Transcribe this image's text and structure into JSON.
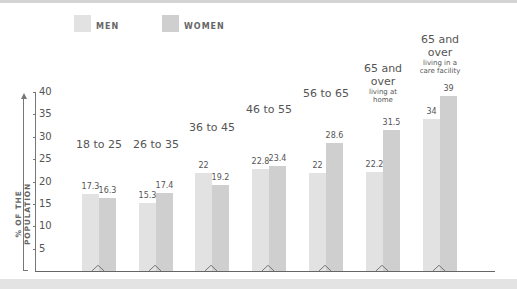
{
  "legend": {
    "men": {
      "label": "MEN",
      "color": "#e2e2e2"
    },
    "women": {
      "label": "WOMEN",
      "color": "#cfcfcf"
    }
  },
  "y_axis": {
    "title": "% OF THE POPULATION",
    "ticks": [
      "40",
      "35",
      "30",
      "25",
      "20",
      "15",
      "10",
      "5"
    ]
  },
  "groups": [
    {
      "title": "18 to 25",
      "subtitle": "",
      "men": "17.3",
      "women": "16.3"
    },
    {
      "title": "26 to 35",
      "subtitle": "",
      "men": "15.3",
      "women": "17.4"
    },
    {
      "title": "36 to 45",
      "subtitle": "",
      "men": "22",
      "women": "19.2"
    },
    {
      "title": "46 to 55",
      "subtitle": "",
      "men": "22.8",
      "women": "23.4"
    },
    {
      "title": "56 to 65",
      "subtitle": "",
      "men": "22",
      "women": "28.6"
    },
    {
      "title": "65 and over",
      "subtitle": "living at home",
      "men": "22.2",
      "women": "31.5"
    },
    {
      "title": "65 and over",
      "subtitle": "living in a care facility",
      "men": "34",
      "women": "39"
    }
  ],
  "chart_data": {
    "type": "bar",
    "title": "",
    "xlabel": "",
    "ylabel": "% OF THE POPULATION",
    "ylim": [
      0,
      40
    ],
    "yticks": [
      5,
      10,
      15,
      20,
      25,
      30,
      35,
      40
    ],
    "grid": false,
    "legend_position": "top",
    "categories": [
      "18 to 25",
      "26 to 35",
      "36 to 45",
      "46 to 55",
      "56 to 65",
      "65 and over living at home",
      "65 and over living in a care facility"
    ],
    "series": [
      {
        "name": "MEN",
        "color": "#e2e2e2",
        "values": [
          17.3,
          15.3,
          22,
          22.8,
          22,
          22.2,
          34
        ]
      },
      {
        "name": "WOMEN",
        "color": "#cfcfcf",
        "values": [
          16.3,
          17.4,
          19.2,
          23.4,
          28.6,
          31.5,
          39
        ]
      }
    ]
  }
}
